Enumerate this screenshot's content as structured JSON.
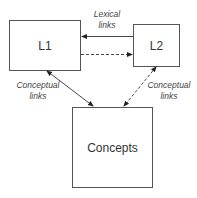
{
  "diagram": {
    "nodes": [
      {
        "id": "L1",
        "label": "L1"
      },
      {
        "id": "L2",
        "label": "L2"
      },
      {
        "id": "concepts",
        "label": "Concepts"
      }
    ],
    "edges": [
      {
        "from": "L2",
        "to": "L1",
        "style": "solid",
        "label": "Lexical links"
      },
      {
        "from": "L1",
        "to": "L2",
        "style": "dashed",
        "label": ""
      },
      {
        "from": "L1",
        "to": "concepts",
        "style": "solid",
        "bidirectional": true,
        "label": "Conceptual links"
      },
      {
        "from": "L2",
        "to": "concepts",
        "style": "dashed",
        "bidirectional": true,
        "label": "Conceptual links"
      }
    ],
    "labels": {
      "lexical_line1": "Lexical",
      "lexical_line2": "links",
      "conceptual_left_line1": "Conceptual",
      "conceptual_left_line2": "links",
      "conceptual_right_line1": "Conceptual",
      "conceptual_right_line2": "links"
    }
  }
}
